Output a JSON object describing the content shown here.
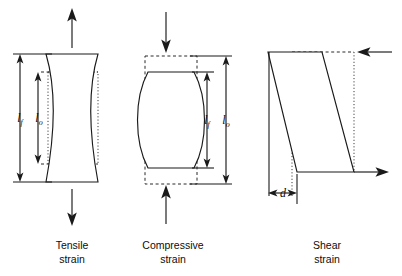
{
  "figure": {
    "background_color": "#ffffff",
    "line_color": "#1a1a1a",
    "width": 402,
    "height": 276
  },
  "panels": [
    {
      "id": "tensile",
      "caption_line1": "Tensile",
      "caption_line2": "strain",
      "shape": "hourglass",
      "load_direction": "away-from-body",
      "arrows": [
        {
          "name": "tensile-load-arrow-top",
          "direction": "up"
        },
        {
          "name": "tensile-load-arrow-bottom",
          "direction": "down"
        }
      ],
      "dimensions": [
        {
          "name": "final-length",
          "label": "l",
          "subscript": "f",
          "meaning": "final length",
          "relative": "longer"
        },
        {
          "name": "original-length",
          "label": "l",
          "subscript": "o",
          "meaning": "original length",
          "relative": "shorter"
        }
      ],
      "reference_outline": "dotted rectangle of original shape"
    },
    {
      "id": "compressive",
      "caption_line1": "Compressive",
      "caption_line2": "strain",
      "shape": "barrel",
      "load_direction": "toward-body",
      "arrows": [
        {
          "name": "compressive-load-arrow-top",
          "direction": "down"
        },
        {
          "name": "compressive-load-arrow-bottom",
          "direction": "up"
        }
      ],
      "dimensions": [
        {
          "name": "final-length",
          "label": "l",
          "subscript": "f",
          "meaning": "final length",
          "relative": "shorter"
        },
        {
          "name": "original-length",
          "label": "l",
          "subscript": "o",
          "meaning": "original length",
          "relative": "longer"
        }
      ],
      "reference_outline": "dashed rectangle of original shape"
    },
    {
      "id": "shear",
      "caption_line1": "Shear",
      "caption_line2": "strain",
      "shape": "parallelogram",
      "load_direction": "opposed-couple",
      "arrows": [
        {
          "name": "shear-load-arrow-top",
          "direction": "left"
        },
        {
          "name": "shear-load-arrow-bottom",
          "direction": "right"
        }
      ],
      "dimensions": [
        {
          "name": "shear-displacement",
          "label": "d",
          "subscript": "",
          "meaning": "shear displacement",
          "relative": "offset"
        }
      ],
      "reference_outline": "dashed/dotted rectangle of original shape"
    }
  ],
  "labels": {
    "l_final": "l",
    "l_final_sub": "f",
    "l_original": "l",
    "l_original_sub": "o",
    "d": "d"
  },
  "captions": {
    "tensile_1": "Tensile",
    "tensile_2": "strain",
    "compressive_1": "Compressive",
    "compressive_2": "strain",
    "shear_1": "Shear",
    "shear_2": "strain"
  }
}
